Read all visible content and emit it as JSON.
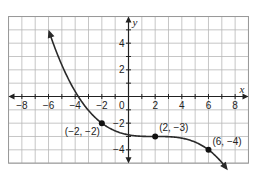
{
  "chart_data": {
    "type": "line",
    "title": "",
    "xlabel": "x",
    "ylabel": "y",
    "xlim": [
      -9,
      9
    ],
    "ylim": [
      -5,
      6
    ],
    "grid": true,
    "x_ticks": [
      -8,
      -6,
      -4,
      -2,
      2,
      4,
      6,
      8
    ],
    "y_ticks": [
      4,
      2,
      -2,
      -4
    ],
    "x_tick_labels": [
      "−8",
      "−6",
      "−4",
      "−2",
      "2",
      "4",
      "6",
      "8"
    ],
    "y_tick_labels": [
      "4",
      "2",
      "−2",
      "−4"
    ],
    "origin_label": "0",
    "series": [
      {
        "name": "curve",
        "description": "Decreasing cubic-like curve with arrows at both ends",
        "x": [
          -6,
          -5,
          -4,
          -3,
          -2,
          -1,
          0,
          1,
          2,
          3,
          4,
          5,
          6,
          7
        ],
        "y": [
          6,
          3.2,
          1.0,
          -0.75,
          -2,
          -2.6,
          -2.9,
          -3.0,
          -3.0,
          -3.05,
          -3.2,
          -3.5,
          -4,
          -5
        ]
      }
    ],
    "points": [
      {
        "x": -2,
        "y": -2,
        "label": "(−2, −2)"
      },
      {
        "x": 2,
        "y": -3,
        "label": "(2, −3)"
      },
      {
        "x": 6,
        "y": -4,
        "label": "(6, −4)"
      }
    ]
  }
}
